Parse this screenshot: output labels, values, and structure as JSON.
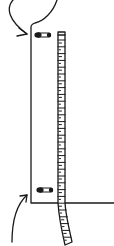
{
  "illustration": {
    "description": "Line drawing of a garment edge with a measuring tape pinned alongside by two safety pins, with curved arrows indicating the top and bottom pin points",
    "colors": {
      "ink": "#1a1a1a",
      "background": "#ffffff",
      "tape_fill": "#ffffff"
    },
    "elements": {
      "top_arrow": {
        "icon": "curved-arrow-icon",
        "direction": "down-right"
      },
      "bottom_arrow": {
        "icon": "curved-arrow-icon",
        "direction": "up-right"
      },
      "top_pin": {
        "icon": "safety-pin-icon"
      },
      "bottom_pin": {
        "icon": "safety-pin-icon"
      },
      "tape": {
        "icon": "measuring-tape-icon",
        "tick_count": 30
      }
    }
  }
}
